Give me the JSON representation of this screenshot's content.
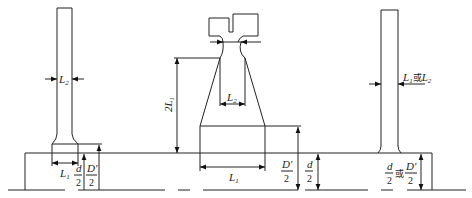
{
  "diagram": {
    "type": "engineering dimension drawing",
    "left_post": {
      "width_label": "L2",
      "base_width_label": "L1",
      "height_labels": {
        "d_over_2": {
          "num": "d",
          "den": "2"
        },
        "Dp_over_2": {
          "num": "D'",
          "den": "2"
        }
      }
    },
    "middle_post": {
      "height_label": "2L1",
      "neck_width_label": "L2",
      "base_width_label": "L1",
      "height_labels": {
        "Dp_over_2": {
          "num": "D'",
          "den": "2"
        },
        "d_over_2": {
          "num": "d",
          "den": "2"
        }
      }
    },
    "right_post": {
      "width_label": {
        "a": "L1",
        "or": "或",
        "b": "L2"
      },
      "height_label": {
        "a": {
          "num": "d",
          "den": "2"
        },
        "or": "或",
        "b": {
          "num": "D'",
          "den": "2"
        }
      }
    }
  }
}
